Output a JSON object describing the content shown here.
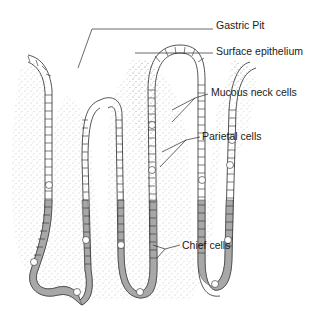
{
  "figure": {
    "labels": [
      {
        "id": "gastric-pit",
        "text": "Gastric Pit",
        "x": 216,
        "y": 19
      },
      {
        "id": "surface-epithelium",
        "text": "Surface epithelium",
        "x": 216,
        "y": 45
      },
      {
        "id": "mucous-neck-cells",
        "text": "Mucous neck cells",
        "x": 211,
        "y": 85
      },
      {
        "id": "parietal-cells",
        "text": "Parietal cells",
        "x": 202,
        "y": 129
      },
      {
        "id": "chief-cells",
        "text": "Chief cells",
        "x": 182,
        "y": 237
      }
    ],
    "colors": {
      "outline": "#2a2a2a",
      "stipple": "#8a8a8a",
      "chief_cell_fill": "#9a9a9a",
      "cell_fill": "#ffffff"
    }
  }
}
